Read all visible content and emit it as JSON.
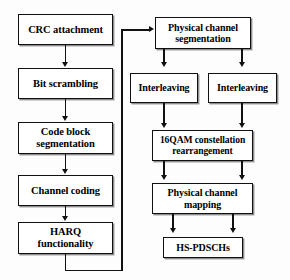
{
  "diagram": {
    "background_color": "#fdfdfd",
    "box_border_color": "#111111",
    "box_fill_color": "#ffffff",
    "connector_color": "#111111",
    "left_chain": [
      {
        "id": "crc-attachment",
        "label": "CRC attachment"
      },
      {
        "id": "bit-scrambling",
        "label": "Bit scrambling"
      },
      {
        "id": "code-block-segmentation",
        "label": "Code block segmentation"
      },
      {
        "id": "channel-coding",
        "label": "Channel coding"
      },
      {
        "id": "harq-functionality",
        "label": "HARQ functionality"
      }
    ],
    "right_chain": [
      {
        "id": "physical-channel-segmentation",
        "label": "Physical channel segmentation"
      },
      {
        "id": "interleaving-left",
        "label": "Interleaving"
      },
      {
        "id": "interleaving-right",
        "label": "Interleaving"
      },
      {
        "id": "qam-rearrangement",
        "label": "16QAM constellation rearrangement"
      },
      {
        "id": "physical-channel-mapping",
        "label": "Physical channel mapping"
      },
      {
        "id": "hs-pdschs",
        "label": "HS-PDSCHs"
      }
    ],
    "connectors": [
      {
        "id": "crc-to-bit-scrambling",
        "from": "crc-attachment",
        "to": "bit-scrambling"
      },
      {
        "id": "bit-scrambling-to-code-block",
        "from": "bit-scrambling",
        "to": "code-block-segmentation"
      },
      {
        "id": "code-block-to-channel-coding",
        "from": "code-block-segmentation",
        "to": "channel-coding"
      },
      {
        "id": "channel-coding-to-harq",
        "from": "channel-coding",
        "to": "harq-functionality"
      },
      {
        "id": "harq-to-physical-channel-segmentation",
        "from": "harq-functionality",
        "to": "physical-channel-segmentation"
      },
      {
        "id": "segmentation-to-interleaving-left",
        "from": "physical-channel-segmentation",
        "to": "interleaving-left"
      },
      {
        "id": "segmentation-to-interleaving-right",
        "from": "physical-channel-segmentation",
        "to": "interleaving-right"
      },
      {
        "id": "interleaving-left-to-qam",
        "from": "interleaving-left",
        "to": "qam-rearrangement"
      },
      {
        "id": "interleaving-right-to-qam",
        "from": "interleaving-right",
        "to": "qam-rearrangement"
      },
      {
        "id": "qam-to-mapping-left",
        "from": "qam-rearrangement",
        "to": "physical-channel-mapping"
      },
      {
        "id": "qam-to-mapping-right",
        "from": "qam-rearrangement",
        "to": "physical-channel-mapping"
      },
      {
        "id": "mapping-to-hs-pdschs-left",
        "from": "physical-channel-mapping",
        "to": "hs-pdschs"
      },
      {
        "id": "mapping-to-hs-pdschs-right",
        "from": "physical-channel-mapping",
        "to": "hs-pdschs"
      }
    ]
  }
}
